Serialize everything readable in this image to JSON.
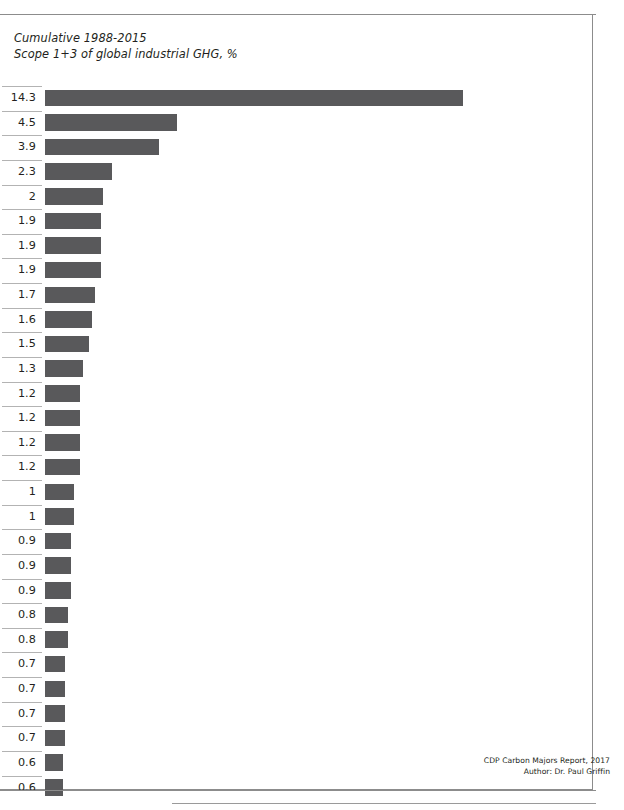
{
  "chart_data": {
    "type": "bar",
    "orientation": "horizontal",
    "title": "Cumulative 1988-2015",
    "subtitle": "Scope 1+3 of global industrial GHG, %",
    "xlabel": "",
    "ylabel": "",
    "grid": false,
    "legend": null,
    "axis_ticks_visible": false,
    "value_labels_position": "left",
    "xlim": [
      0,
      14.3
    ],
    "categories": [
      "1",
      "2",
      "3",
      "4",
      "5",
      "6",
      "7",
      "8",
      "9",
      "10",
      "11",
      "12",
      "13",
      "14",
      "15",
      "16",
      "17",
      "18",
      "19",
      "20",
      "21",
      "22",
      "23",
      "24",
      "25",
      "26",
      "27",
      "28",
      "29"
    ],
    "values": [
      14.3,
      4.5,
      3.9,
      2.3,
      2,
      1.9,
      1.9,
      1.9,
      1.7,
      1.6,
      1.5,
      1.3,
      1.2,
      1.2,
      1.2,
      1.2,
      1,
      1,
      0.9,
      0.9,
      0.9,
      0.8,
      0.8,
      0.7,
      0.7,
      0.7,
      0.7,
      0.6,
      0.6
    ],
    "value_labels": [
      "14.3",
      "4.5",
      "3.9",
      "2.3",
      "2",
      "1.9",
      "1.9",
      "1.9",
      "1.7",
      "1.6",
      "1.5",
      "1.3",
      "1.2",
      "1.2",
      "1.2",
      "1.2",
      "1",
      "1",
      "0.9",
      "0.9",
      "0.9",
      "0.8",
      "0.8",
      "0.7",
      "0.7",
      "0.7",
      "0.7",
      "0.6",
      "0.6"
    ],
    "bar_color": "#59595b",
    "rule_color": "#b3b3b3"
  },
  "heading": {
    "line1": "Cumulative 1988-2015",
    "line2": "Scope 1+3 of global industrial GHG, %"
  },
  "footer": {
    "line1": "CDP Carbon Majors Report, 2017",
    "line2": "Author: Dr. Paul Griffin"
  }
}
